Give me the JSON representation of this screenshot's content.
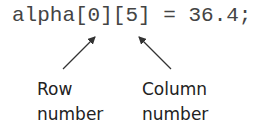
{
  "code": {
    "statement": "alpha[0][5] = 36.4;"
  },
  "annotations": {
    "row": {
      "line1": "Row",
      "line2": "number"
    },
    "column": {
      "line1": "Column",
      "line2": "number"
    }
  },
  "colors": {
    "code_text": "#444444",
    "label_text": "#222222",
    "arrow": "#333333"
  }
}
